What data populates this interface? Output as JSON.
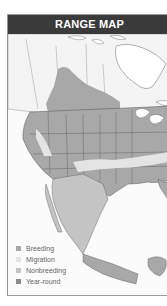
{
  "header": {
    "title": "RANGE MAP"
  },
  "legend": {
    "items": [
      {
        "label": "Breeding",
        "color": "#a8a8a8"
      },
      {
        "label": "Migration",
        "color": "#e4e4e4"
      },
      {
        "label": "Nonbreeding",
        "color": "#c4c4c4"
      },
      {
        "label": "Year-round",
        "color": "#8c8c8c"
      }
    ]
  },
  "colors": {
    "land": "#f4f4f4",
    "water": "#ffffff",
    "breeding": "#a8a8a8",
    "migration": "#e4e4e4",
    "nonbreeding": "#c4c4c4",
    "yearround": "#8c8c8c",
    "borders": "#555555",
    "header_bg": "#3a3a3a"
  }
}
